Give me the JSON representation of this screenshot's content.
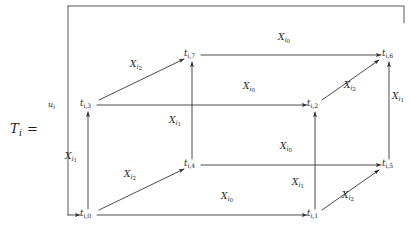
{
  "formula": {
    "lhs_symbol": "T",
    "lhs_sub": "i",
    "equals": "=",
    "lhs_full": "T_i ="
  },
  "frame": {
    "input_arrow_label_symbol": "u",
    "input_arrow_label_sub": "i",
    "input_arrow_label_full": "u_i"
  },
  "diagram": {
    "type": "cube-commutative-diagram",
    "stroke_color": "#2b2b2b",
    "nodes": [
      {
        "id": "t0",
        "symbol": "t",
        "sub": "i,0",
        "label": "t_{i,0}",
        "x": 84,
        "y": 215
      },
      {
        "id": "t1",
        "symbol": "t",
        "sub": "i,1",
        "label": "t_{i,1}",
        "x": 311,
        "y": 215
      },
      {
        "id": "t2",
        "symbol": "t",
        "sub": "i,2",
        "label": "t_{i,2}",
        "x": 311,
        "y": 105
      },
      {
        "id": "t3",
        "symbol": "t",
        "sub": "i,3",
        "label": "t_{i,3}",
        "x": 84,
        "y": 105
      },
      {
        "id": "t4",
        "symbol": "t",
        "sub": "i,4",
        "label": "t_{i,4}",
        "x": 188,
        "y": 165
      },
      {
        "id": "t5",
        "symbol": "t",
        "sub": "i,5",
        "label": "t_{i,5}",
        "x": 385,
        "y": 165
      },
      {
        "id": "t6",
        "symbol": "t",
        "sub": "i,6",
        "label": "t_{i,6}",
        "x": 385,
        "y": 55
      },
      {
        "id": "t7",
        "symbol": "t",
        "sub": "i,7",
        "label": "t_{i,7}",
        "x": 188,
        "y": 55
      }
    ],
    "edges": [
      {
        "from": "t0",
        "to": "t1",
        "label_symbol": "X",
        "label_sub": "i",
        "label_subsub": "0",
        "label": "X_{i_0}",
        "orientation": "horizontal"
      },
      {
        "from": "t3",
        "to": "t2",
        "label_symbol": "X",
        "label_sub": "i",
        "label_subsub": "0",
        "label": "X_{i_0}",
        "orientation": "horizontal"
      },
      {
        "from": "t4",
        "to": "t5",
        "label_symbol": "X",
        "label_sub": "i",
        "label_subsub": "0",
        "label": "X_{i_0}",
        "orientation": "horizontal"
      },
      {
        "from": "t7",
        "to": "t6",
        "label_symbol": "X",
        "label_sub": "i",
        "label_subsub": "0",
        "label": "X_{i_0}",
        "orientation": "horizontal"
      },
      {
        "from": "t0",
        "to": "t3",
        "label_symbol": "X",
        "label_sub": "i",
        "label_subsub": "1",
        "label": "X_{i_1}",
        "orientation": "vertical"
      },
      {
        "from": "t1",
        "to": "t2",
        "label_symbol": "X",
        "label_sub": "i",
        "label_subsub": "1",
        "label": "X_{i_1}",
        "orientation": "vertical"
      },
      {
        "from": "t4",
        "to": "t7",
        "label_symbol": "X",
        "label_sub": "i",
        "label_subsub": "1",
        "label": "X_{i_1}",
        "orientation": "vertical"
      },
      {
        "from": "t5",
        "to": "t6",
        "label_symbol": "X",
        "label_sub": "i",
        "label_subsub": "1",
        "label": "X_{i_1}",
        "orientation": "vertical"
      },
      {
        "from": "t0",
        "to": "t4",
        "label_symbol": "X",
        "label_sub": "i",
        "label_subsub": "2",
        "label": "X_{i_2}",
        "orientation": "diagonal"
      },
      {
        "from": "t1",
        "to": "t5",
        "label_symbol": "X",
        "label_sub": "i",
        "label_subsub": "2",
        "label": "X_{i_2}",
        "orientation": "diagonal"
      },
      {
        "from": "t3",
        "to": "t7",
        "label_symbol": "X",
        "label_sub": "i",
        "label_subsub": "2",
        "label": "X_{i_2}",
        "orientation": "diagonal"
      },
      {
        "from": "t2",
        "to": "t6",
        "label_symbol": "X",
        "label_sub": "i",
        "label_subsub": "2",
        "label": "X_{i_2}",
        "orientation": "diagonal"
      }
    ],
    "edge_labels": [
      {
        "id": "lbl-x0-top",
        "text": "X_{i_0}",
        "x": 285,
        "y": 41
      },
      {
        "id": "lbl-x0-mid",
        "text": "X_{i_0}",
        "x": 250,
        "y": 90
      },
      {
        "id": "lbl-x0-lower",
        "text": "X_{i_0}",
        "x": 287,
        "y": 150
      },
      {
        "id": "lbl-x0-bottom",
        "text": "X_{i_0}",
        "x": 228,
        "y": 200
      },
      {
        "id": "lbl-x1-left",
        "text": "X_{i_1}",
        "x": 72,
        "y": 160
      },
      {
        "id": "lbl-x1-center",
        "text": "X_{i_1}",
        "x": 176,
        "y": 124
      },
      {
        "id": "lbl-x1-inner",
        "text": "X_{i_1}",
        "x": 299,
        "y": 186
      },
      {
        "id": "lbl-x1-right",
        "text": "X_{i_1}",
        "x": 396,
        "y": 100
      },
      {
        "id": "lbl-x2-upper",
        "text": "X_{i_2}",
        "x": 137,
        "y": 68
      },
      {
        "id": "lbl-x2-lower",
        "text": "X_{i_2}",
        "x": 131,
        "y": 178
      },
      {
        "id": "lbl-x2-right",
        "text": "X_{i_2}",
        "x": 351,
        "y": 89
      },
      {
        "id": "lbl-x2-br",
        "text": "X_{i_2}",
        "x": 349,
        "y": 199
      }
    ]
  }
}
